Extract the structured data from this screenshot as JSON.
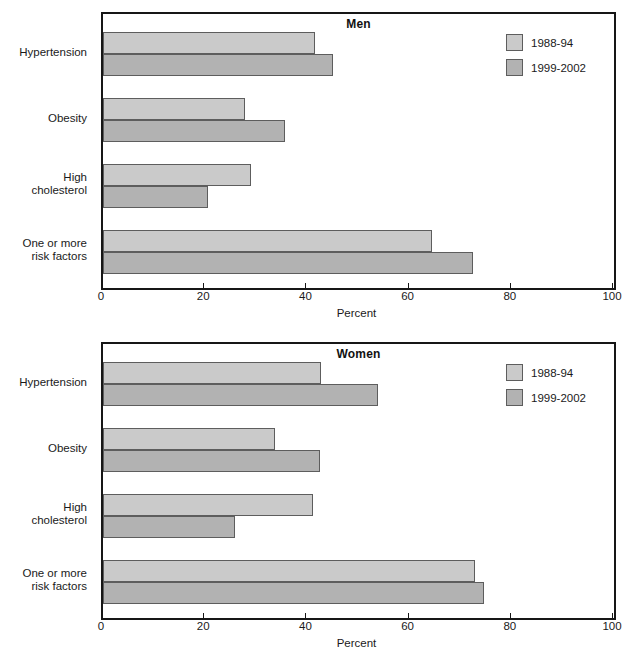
{
  "figure": {
    "background": "#ffffff",
    "series_colors": [
      "#cacaca",
      "#b2b2b2"
    ],
    "axis_color": "#161616"
  },
  "legend": {
    "entries": [
      {
        "label": "1988-94",
        "color": "#cacaca"
      },
      {
        "label": "1999-2002",
        "color": "#b2b2b2"
      }
    ]
  },
  "axis": {
    "xlabel": "Percent",
    "ticks": [
      "0",
      "20",
      "40",
      "60",
      "80",
      "100"
    ]
  },
  "categories": [
    {
      "line1": "Hypertension",
      "line2": ""
    },
    {
      "line1": "Obesity",
      "line2": ""
    },
    {
      "line1": "High",
      "line2": "cholesterol"
    },
    {
      "line1": "One or more",
      "line2": "risk factors"
    }
  ],
  "panels": [
    {
      "title": "Men"
    },
    {
      "title": "Women"
    }
  ],
  "chart_data": [
    {
      "type": "bar",
      "title": "Men",
      "orientation": "horizontal",
      "categories": [
        "Hypertension",
        "Obesity",
        "High cholesterol",
        "One or more risk factors"
      ],
      "series": [
        {
          "name": "1988-94",
          "values": [
            41.5,
            27.8,
            28.9,
            64.4
          ]
        },
        {
          "name": "1999-2002",
          "values": [
            45.0,
            35.6,
            20.5,
            72.5
          ]
        }
      ],
      "xlabel": "Percent",
      "ylabel": "",
      "xlim": [
        0,
        100
      ],
      "xticks": [
        0,
        20,
        40,
        60,
        80,
        100
      ],
      "grid": false,
      "legend_position": "top-right"
    },
    {
      "type": "bar",
      "title": "Women",
      "orientation": "horizontal",
      "categories": [
        "Hypertension",
        "Obesity",
        "High cholesterol",
        "One or more risk factors"
      ],
      "series": [
        {
          "name": "1988-94",
          "values": [
            42.7,
            33.7,
            41.0,
            72.8
          ]
        },
        {
          "name": "1999-2002",
          "values": [
            53.8,
            42.5,
            25.8,
            74.6
          ]
        }
      ],
      "xlabel": "Percent",
      "ylabel": "",
      "xlim": [
        0,
        100
      ],
      "xticks": [
        0,
        20,
        40,
        60,
        80,
        100
      ],
      "grid": false,
      "legend_position": "top-right"
    }
  ]
}
